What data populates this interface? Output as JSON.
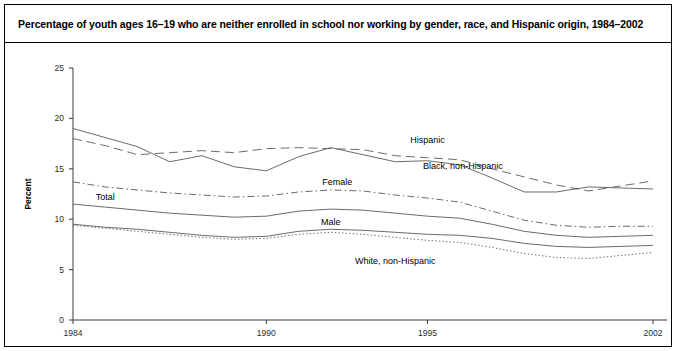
{
  "figure": {
    "title": "Percentage of youth ages 16–19 who are neither enrolled in school nor working by gender, race, and Hispanic origin, 1984–2002"
  },
  "chart_data": {
    "type": "line",
    "title": "Percentage of youth ages 16–19 who are neither enrolled in school nor working by gender, race, and Hispanic origin, 1984–2002",
    "xlabel": "",
    "ylabel": "Percent",
    "xlim": [
      1984,
      2002
    ],
    "ylim": [
      0,
      25
    ],
    "ytick_labels": [
      "0",
      "5",
      "10",
      "15",
      "20",
      "25"
    ],
    "yticks": [
      0,
      5,
      10,
      15,
      20,
      25
    ],
    "xtick_labels": [
      "1984",
      "1990",
      "1995",
      "2002"
    ],
    "xticks": [
      1984,
      1990,
      1995,
      2002
    ],
    "grid": false,
    "legend_position": "inline-labels",
    "x": [
      1984,
      1985,
      1986,
      1987,
      1988,
      1989,
      1990,
      1991,
      1992,
      1993,
      1994,
      1995,
      1996,
      1997,
      1998,
      1999,
      2000,
      2001,
      2002
    ],
    "series": [
      {
        "name": "Black, non-Hispanic",
        "style": "solid",
        "label": "Black, non-Hispanic",
        "label_x": 2994,
        "values": [
          19.0,
          18.1,
          17.2,
          15.7,
          16.3,
          15.2,
          14.8,
          16.2,
          17.1,
          16.4,
          15.7,
          15.8,
          15.4,
          14.1,
          12.7,
          12.7,
          13.2,
          13.1,
          13.0
        ]
      },
      {
        "name": "Hispanic",
        "style": "longdash",
        "label": "Hispanic",
        "values": [
          18.0,
          17.3,
          16.4,
          16.6,
          16.8,
          16.6,
          17.0,
          17.1,
          17.0,
          16.9,
          16.3,
          16.1,
          15.9,
          15.0,
          14.2,
          13.4,
          12.8,
          13.3,
          13.8
        ]
      },
      {
        "name": "Female",
        "style": "dashdot",
        "label": "Female",
        "values": [
          13.7,
          13.2,
          12.9,
          12.6,
          12.4,
          12.2,
          12.3,
          12.7,
          12.9,
          12.8,
          12.4,
          12.1,
          11.7,
          10.8,
          9.9,
          9.4,
          9.2,
          9.3,
          9.3
        ]
      },
      {
        "name": "Total",
        "style": "solid",
        "label": "Total",
        "values": [
          11.5,
          11.2,
          10.9,
          10.6,
          10.4,
          10.2,
          10.3,
          10.8,
          11.0,
          10.9,
          10.6,
          10.3,
          10.1,
          9.5,
          8.8,
          8.4,
          8.2,
          8.3,
          8.4
        ]
      },
      {
        "name": "Male",
        "style": "solid",
        "label": "Male",
        "values": [
          9.5,
          9.2,
          9.0,
          8.7,
          8.4,
          8.2,
          8.3,
          8.8,
          9.0,
          8.9,
          8.7,
          8.5,
          8.4,
          8.1,
          7.6,
          7.3,
          7.2,
          7.3,
          7.4
        ]
      },
      {
        "name": "White, non-Hispanic",
        "style": "dotted",
        "label": "White, non-Hispanic",
        "values": [
          9.4,
          9.1,
          8.8,
          8.5,
          8.2,
          8.0,
          8.1,
          8.5,
          8.7,
          8.5,
          8.2,
          7.9,
          7.7,
          7.2,
          6.6,
          6.2,
          6.1,
          6.4,
          6.7
        ]
      }
    ],
    "annotations": [
      {
        "text": "Hispanic",
        "x": 1995.0,
        "y": 17.6
      },
      {
        "text": "Black, non-Hispanic",
        "x": 1996.1,
        "y": 15.0
      },
      {
        "text": "Female",
        "x": 1992.2,
        "y": 13.4
      },
      {
        "text": "Total",
        "x": 1985.0,
        "y": 11.9
      },
      {
        "text": "Male",
        "x": 1992.0,
        "y": 9.4
      },
      {
        "text": "White, non-Hispanic",
        "x": 1994.0,
        "y": 5.6
      }
    ]
  }
}
